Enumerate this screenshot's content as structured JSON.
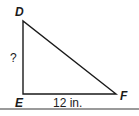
{
  "diagram": {
    "type": "right-triangle",
    "vertices": {
      "D": {
        "label": "D"
      },
      "E": {
        "label": "E"
      },
      "F": {
        "label": "F"
      }
    },
    "sides": {
      "DE": {
        "label": "?"
      },
      "EF": {
        "label": "12 in."
      }
    },
    "colors": {
      "stroke": "#1a1a1a",
      "rule": "#9a9a9a"
    }
  }
}
